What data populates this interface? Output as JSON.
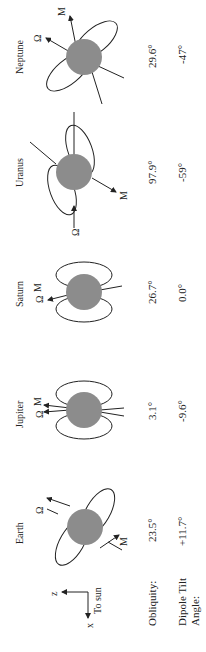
{
  "axes": {
    "z_label": "z",
    "x_label": "x",
    "sun_label": "To sun"
  },
  "row_labels": {
    "obliquity": "Obliquity:",
    "dipole_line1": "Dipole Tilt",
    "dipole_line2": "Angle:"
  },
  "symbols": {
    "spin": "Ω",
    "magnetic": "M"
  },
  "planets": [
    {
      "name": "Earth",
      "obliquity": "23.5°",
      "dipole_tilt": "+11.7°"
    },
    {
      "name": "Jupiter",
      "obliquity": "3.1°",
      "dipole_tilt": "-9.6°"
    },
    {
      "name": "Saturn",
      "obliquity": "26.7°",
      "dipole_tilt": "0.0°"
    },
    {
      "name": "Uranus",
      "obliquity": "97.9°",
      "dipole_tilt": "-59°"
    },
    {
      "name": "Neptune",
      "obliquity": "29.6°",
      "dipole_tilt": "-47°"
    }
  ],
  "colors": {
    "planet_fill": "#8c8c8c",
    "line": "#222222"
  }
}
